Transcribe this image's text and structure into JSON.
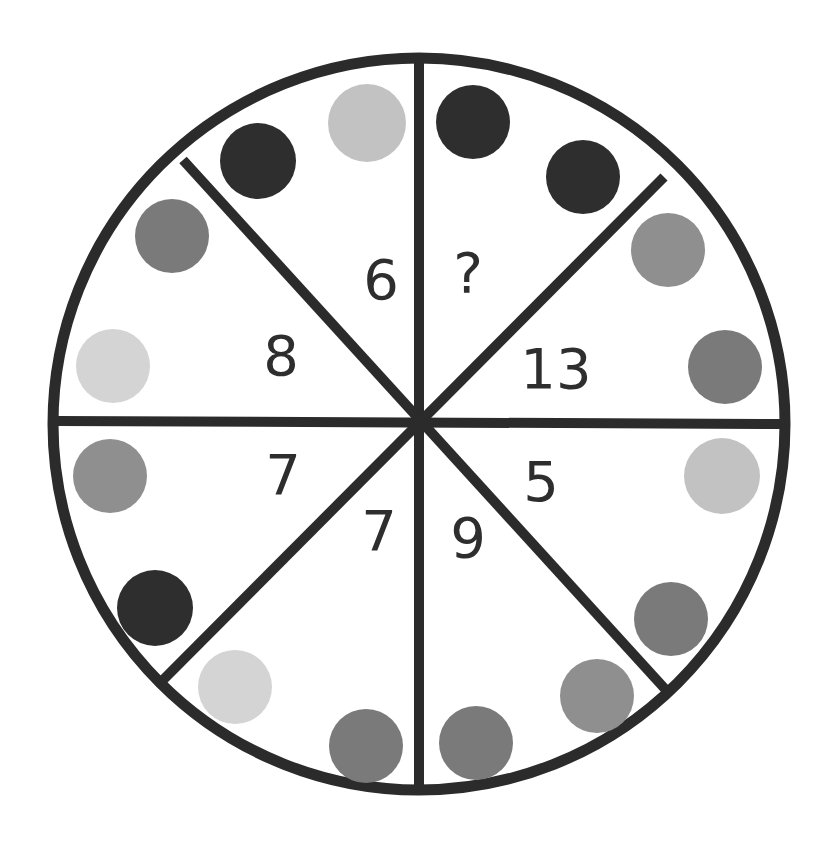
{
  "puzzle": {
    "type": "circle-number-puzzle",
    "colors": {
      "outline": "#2b2b2b",
      "black": "#2e2e2e",
      "dark_gray": "#7a7a7a",
      "mid_gray": "#8f8f8f",
      "light_gray": "#c2c2c2",
      "pale_gray": "#d4d4d4"
    },
    "segments": [
      {
        "id": "top-left",
        "number": "6",
        "circles": [
          "black",
          "light_gray"
        ]
      },
      {
        "id": "top-right",
        "number": "?",
        "circles": [
          "black",
          "black"
        ]
      },
      {
        "id": "right-upper",
        "number": "13",
        "circles": [
          "mid_gray",
          "dark_gray"
        ]
      },
      {
        "id": "right-lower",
        "number": "5",
        "circles": [
          "light_gray",
          "dark_gray"
        ]
      },
      {
        "id": "bottom-right",
        "number": "9",
        "circles": [
          "mid_gray",
          "dark_gray"
        ]
      },
      {
        "id": "bottom-left",
        "number": "7",
        "circles": [
          "pale_gray",
          "dark_gray"
        ]
      },
      {
        "id": "left-lower",
        "number": "7",
        "circles": [
          "mid_gray",
          "black"
        ]
      },
      {
        "id": "left-upper",
        "number": "8",
        "circles": [
          "dark_gray",
          "pale_gray"
        ]
      }
    ]
  }
}
